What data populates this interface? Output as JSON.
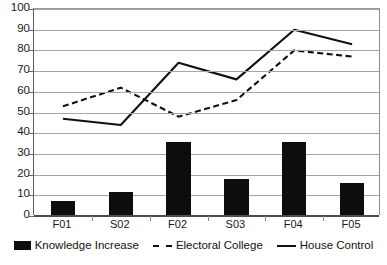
{
  "chart_data": {
    "type": "bar",
    "title": "",
    "subtitle": "",
    "xlabel": "",
    "ylabel": "",
    "ylim": [
      0,
      100
    ],
    "y_ticks": [
      0,
      10,
      20,
      30,
      40,
      50,
      60,
      70,
      80,
      90,
      100
    ],
    "grid": true,
    "legend_position": "bottom",
    "categories": [
      "F01",
      "S02",
      "F02",
      "S03",
      "F04",
      "F05"
    ],
    "series": [
      {
        "name": "Knowledge Increase",
        "type": "bar",
        "color": "#0d0d0d",
        "values": [
          7,
          11,
          35.5,
          17.5,
          35.5,
          15.5
        ]
      },
      {
        "name": "Electoral College",
        "type": "line",
        "style": "dashed",
        "color": "#111111",
        "values": [
          53,
          62,
          48,
          56,
          80,
          77
        ]
      },
      {
        "name": "House Control",
        "type": "line",
        "style": "solid",
        "color": "#111111",
        "values": [
          47,
          44,
          74,
          66,
          90,
          83
        ]
      }
    ]
  },
  "axes": {
    "y_tick_labels": [
      "0",
      "10",
      "20",
      "30",
      "40",
      "50",
      "60",
      "70",
      "80",
      "90",
      "100"
    ],
    "x_tick_labels": [
      "F01",
      "S02",
      "F02",
      "S03",
      "F04",
      "F05"
    ]
  },
  "legend": {
    "items": [
      {
        "label": "Knowledge Increase",
        "marker": "bar-swatch-icon"
      },
      {
        "label": "Electoral College",
        "marker": "dashed-line-icon"
      },
      {
        "label": "House Control",
        "marker": "solid-line-icon"
      }
    ]
  }
}
